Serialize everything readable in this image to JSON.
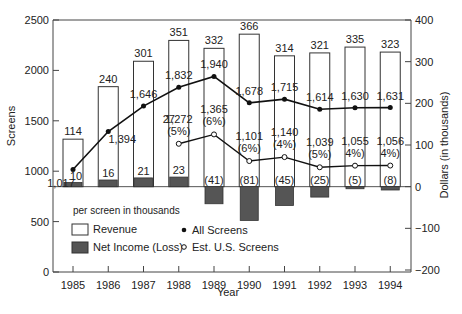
{
  "chart_data": {
    "type": "bar",
    "title": "",
    "xlabel": "Year",
    "ylabel": "Screens",
    "y2label": "Dollars (in thousands)",
    "categories": [
      "1985",
      "1986",
      "1987",
      "1988",
      "1989",
      "1990",
      "1991",
      "1992",
      "1993",
      "1994"
    ],
    "ylim": [
      0,
      2500
    ],
    "y_ticks": [
      0,
      500,
      1000,
      1500,
      2000,
      2500
    ],
    "y2lim": [
      -200,
      400
    ],
    "y2_ticks": [
      -200,
      -100,
      0,
      100,
      200,
      300,
      400
    ],
    "grid": false,
    "legend_title": "per screen in thousands",
    "legend": [
      "Revenue",
      "Net Income (Loss)",
      "All Screens",
      "Est. U.S. Screens"
    ],
    "series": [
      {
        "name": "Revenue",
        "axis": "right",
        "kind": "bar-outline",
        "values": [
          114,
          240,
          301,
          351,
          332,
          366,
          314,
          321,
          335,
          323
        ],
        "labels": [
          "114",
          "240",
          "301",
          "351",
          "332",
          "366",
          "314",
          "321",
          "335",
          "323"
        ]
      },
      {
        "name": "Net Income (Loss)",
        "axis": "right",
        "kind": "bar-filled",
        "values": [
          10,
          16,
          21,
          23,
          -41,
          -81,
          -45,
          -25,
          -5,
          -8
        ],
        "labels": [
          "10",
          "16",
          "21",
          "23",
          "(41)",
          "(81)",
          "(45)",
          "(25)",
          "(5)",
          "(8)"
        ]
      },
      {
        "name": "All Screens",
        "axis": "left",
        "kind": "line-filled-marker",
        "values": [
          1017,
          1394,
          1646,
          1832,
          1940,
          1678,
          1715,
          1614,
          1630,
          1631
        ],
        "labels": [
          "1,017",
          "1,394",
          "1,646",
          "1,832",
          "1,940",
          "1,678",
          "1,715",
          "1,614",
          "1,630",
          "1,631"
        ]
      },
      {
        "name": "Est. U.S. Screens",
        "axis": "left",
        "kind": "line-open-marker",
        "x": [
          "1988",
          "1989",
          "1990",
          "1991",
          "1992",
          "1993",
          "1994"
        ],
        "values": [
          1272,
          1365,
          1101,
          1140,
          1039,
          1055,
          1056
        ],
        "labels": [
          "1,272",
          "1,365",
          "1,101",
          "1,140",
          "1,039",
          "1,055",
          "1,056"
        ],
        "pct_labels": [
          "(5%)",
          "(6%)",
          "(6%)",
          "(4%)",
          "(5%)",
          "4%)",
          "4%)"
        ]
      }
    ],
    "annotations": [
      "27"
    ]
  },
  "footer_text": ""
}
